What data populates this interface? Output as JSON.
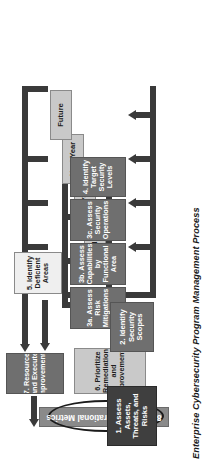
{
  "diagram": {
    "title": "Enterprise Cybersecurity Program Management Process",
    "type": "flowchart",
    "orientation": "rotated-90",
    "nodes": [
      {
        "id": "n1",
        "label": "1. Assess Assets,\nThreats, and\nRisks",
        "style": "dark"
      },
      {
        "id": "n2",
        "label": "2. Identify\nSecurity Scopes",
        "style": "mid"
      },
      {
        "id": "n3a",
        "label": "3a. Assess\nRisk Mitigations",
        "style": "mid"
      },
      {
        "id": "n3b",
        "label": "3b. Assess\nCapabilities by\nFunctional Area",
        "style": "mid"
      },
      {
        "id": "n3c",
        "label": "3c. Assess\nSecurity\nOperations",
        "style": "mid"
      },
      {
        "id": "n4",
        "label": "4. Identify Target\nSecurity Levels",
        "style": "mid"
      },
      {
        "id": "n5",
        "label": "5. Identify\nDeficient\nAreas",
        "style": "white"
      },
      {
        "id": "n6",
        "label": "6. Prioritize\nRemediation and\nImprovements",
        "style": "light"
      },
      {
        "id": "n7",
        "label": "7. Resource\nand Execute\nImprovements",
        "style": "mid"
      },
      {
        "id": "n8",
        "label": "8. Collect Operational Metrics",
        "style": "oval"
      },
      {
        "id": "t1",
        "label": "Immediate",
        "style": "light"
      },
      {
        "id": "t2",
        "label": "This Year",
        "style": "light"
      },
      {
        "id": "t3",
        "label": "Next Year",
        "style": "light"
      },
      {
        "id": "t4",
        "label": "Future",
        "style": "light"
      }
    ],
    "edges": [
      {
        "from": "n1",
        "to": "n2"
      },
      {
        "from": "n2",
        "to": "n3a"
      },
      {
        "from": "n2",
        "to": "n3b"
      },
      {
        "from": "n2",
        "to": "n3c"
      },
      {
        "from": "n2",
        "to": "n4"
      },
      {
        "from": "n3a",
        "to": "n5"
      },
      {
        "from": "n3b",
        "to": "n5"
      },
      {
        "from": "n3c",
        "to": "n5"
      },
      {
        "from": "n4",
        "to": "n5"
      },
      {
        "from": "n5",
        "to": "n6"
      },
      {
        "from": "n6",
        "to": "t1"
      },
      {
        "from": "n6",
        "to": "t2"
      },
      {
        "from": "n6",
        "to": "t3"
      },
      {
        "from": "n6",
        "to": "t4"
      },
      {
        "from": "t1",
        "to": "n7"
      },
      {
        "from": "t2",
        "to": "n7"
      },
      {
        "from": "t3",
        "to": "n7"
      },
      {
        "from": "t4",
        "to": "n7"
      },
      {
        "from": "n7",
        "to": "n8"
      },
      {
        "from": "n8",
        "to": "n1"
      }
    ],
    "colors": {
      "dark": "#3f3f3f",
      "mid": "#6f6f6f",
      "light": "#c9c9c9",
      "white": "#efefef",
      "line": "#3a3a3a",
      "metrics_bar": "#8a8a8a",
      "background": "#ffffff"
    }
  }
}
